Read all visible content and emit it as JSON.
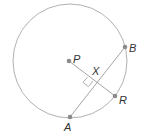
{
  "diagram": {
    "type": "circle-geometry",
    "colors": {
      "circle": "#a8a8a8",
      "lines": "#9a9a9a",
      "points": "#8a8a8a",
      "labels": "#333333"
    },
    "circle": {
      "center_label": "P",
      "cx": 70,
      "cy": 61,
      "r": 57
    },
    "points": [
      {
        "label": "P",
        "x": 69,
        "y": 61
      },
      {
        "label": "B",
        "x": 125,
        "y": 47
      },
      {
        "label": "R",
        "x": 115,
        "y": 96
      },
      {
        "label": "A",
        "x": 70,
        "y": 117
      },
      {
        "label": "X",
        "x": 93,
        "y": 81
      }
    ],
    "segments": [
      {
        "from": "A",
        "to": "B"
      },
      {
        "from": "P",
        "to": "R"
      }
    ],
    "right_angle_at": "X",
    "labels": {
      "P": "P",
      "B": "B",
      "R": "R",
      "A": "A",
      "X": "X"
    }
  }
}
